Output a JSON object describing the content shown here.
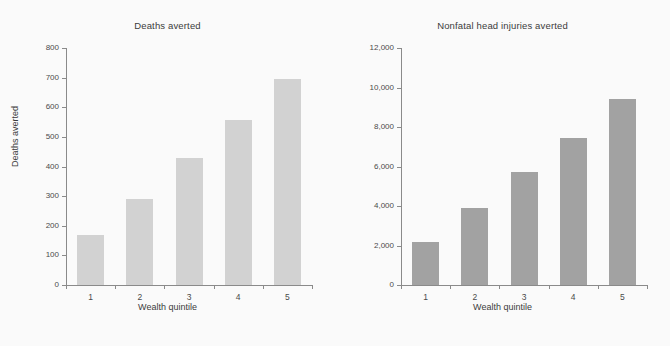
{
  "figure": {
    "background_color": "#fafafa",
    "panel_count": 2
  },
  "chart_data": [
    {
      "type": "bar",
      "title": "Deaths averted",
      "xlabel": "Wealth quintile",
      "ylabel": "Deaths averted",
      "categories": [
        "1",
        "2",
        "3",
        "4",
        "5"
      ],
      "values": [
        170,
        290,
        430,
        557,
        697
      ],
      "ylim": [
        0,
        800
      ],
      "yticks": [
        0,
        100,
        200,
        300,
        400,
        500,
        600,
        700,
        800
      ],
      "ytick_labels": [
        "0",
        "100",
        "200",
        "300",
        "400",
        "500",
        "600",
        "700",
        "800"
      ],
      "bar_color": "#d2d2d2",
      "grid": false,
      "legend": "none"
    },
    {
      "type": "bar",
      "title": "Nonfatal head injuries averted",
      "xlabel": "Wealth quintile",
      "ylabel": "Injuries averted",
      "categories": [
        "1",
        "2",
        "3",
        "4",
        "5"
      ],
      "values": [
        2200,
        3880,
        5700,
        7450,
        9400
      ],
      "ylim": [
        0,
        12000
      ],
      "yticks": [
        0,
        2000,
        4000,
        6000,
        8000,
        10000,
        12000
      ],
      "ytick_labels": [
        "0",
        "2,000",
        "4,000",
        "6,000",
        "8,000",
        "10,000",
        "12,000"
      ],
      "bar_color": "#a2a2a2",
      "grid": false,
      "legend": "none"
    }
  ]
}
